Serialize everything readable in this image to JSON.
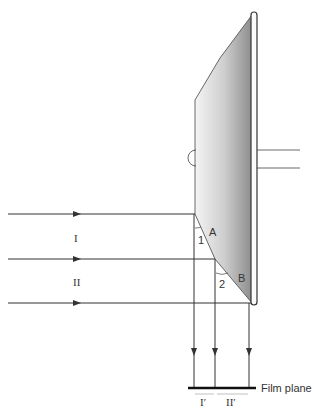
{
  "diagram": {
    "beams_in": [
      "I",
      "II"
    ],
    "points": {
      "a": "A",
      "b": "B"
    },
    "angles": {
      "one": "1",
      "two": "2"
    },
    "film": {
      "label": "Film plane",
      "region_1": "I′",
      "region_2": "II′"
    }
  },
  "colors": {
    "line": "#333333",
    "mirror_dark": "#8a8a8a",
    "mirror_light": "#f2f2f2"
  }
}
